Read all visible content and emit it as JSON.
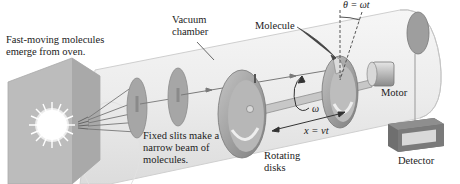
{
  "diagram": {
    "labels": {
      "oven": "Fast-moving molecules\nemerge from oven.",
      "vacuum": "Vacuum\nchamber",
      "molecule": "Molecule",
      "theta": "θ = ωt",
      "omega": "ω",
      "motor": "Motor",
      "slits": "Fixed slits make a\nnarrow beam of\nmolecules.",
      "distance": "x = vt",
      "rotating": "Rotating\ndisks",
      "detector": "Detector"
    },
    "components": [
      "oven",
      "fixed-slit-disk-1",
      "fixed-slit-disk-2",
      "rotating-disk-1",
      "rotating-disk-2",
      "axle",
      "motor",
      "detector-target",
      "detector-box",
      "vacuum-chamber-cylinder"
    ],
    "colors": {
      "cylinder": "#ececec",
      "cylinder_edge": "#c8c8c8",
      "oven": "#bdbdbd",
      "disk": "#9a9a9a",
      "disk_light": "#d6d6d6",
      "beam": "#777777",
      "detector_box": "#7a7a7a",
      "detector_window": "#d9d9d9",
      "text": "#222222"
    }
  }
}
